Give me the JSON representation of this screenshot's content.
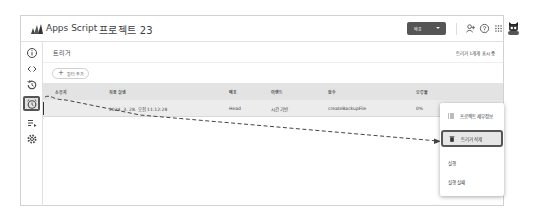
{
  "header": {
    "app_name": "Apps Script",
    "project_name": "프로젝트 23",
    "deploy_button": "배포",
    "icons": [
      "add-person-icon",
      "help-icon",
      "apps-grid-icon",
      "avatar"
    ]
  },
  "rail": {
    "items": [
      {
        "name": "overview",
        "icon": "info-icon"
      },
      {
        "name": "editor",
        "icon": "code-icon"
      },
      {
        "name": "triggers-history",
        "icon": "history-icon"
      },
      {
        "name": "triggers",
        "icon": "alarm-clock-icon",
        "active": true
      },
      {
        "name": "executions",
        "icon": "list-run-icon"
      },
      {
        "name": "settings",
        "icon": "gear-icon"
      }
    ]
  },
  "page": {
    "title": "트리거",
    "count_text": "트리거 1개개 표시 중",
    "filter_chip": "필터 추가"
  },
  "table": {
    "columns": [
      "소유자",
      "최종 실행",
      "배포",
      "이벤트",
      "함수",
      "오류율"
    ],
    "rows": [
      {
        "owner": "",
        "last_run": "2024. 3. 28. 오전 11:12:28",
        "deployment": "Head",
        "event": "시간 기반",
        "function": "createBackupFile",
        "error_rate": "0%"
      }
    ]
  },
  "context_menu": {
    "items": [
      {
        "label": "프로젝트 세부정보",
        "icon": "list-icon"
      },
      {
        "label": "트리거 삭제",
        "icon": "trash-icon",
        "highlighted": true
      },
      {
        "label": "실행"
      },
      {
        "label": "실행 실패"
      }
    ]
  },
  "colors": {
    "highlight_border": "#555555",
    "deploy_button_bg": "#555555",
    "table_header_bg": "#e3e3e3",
    "row_bg": "#ececec"
  }
}
